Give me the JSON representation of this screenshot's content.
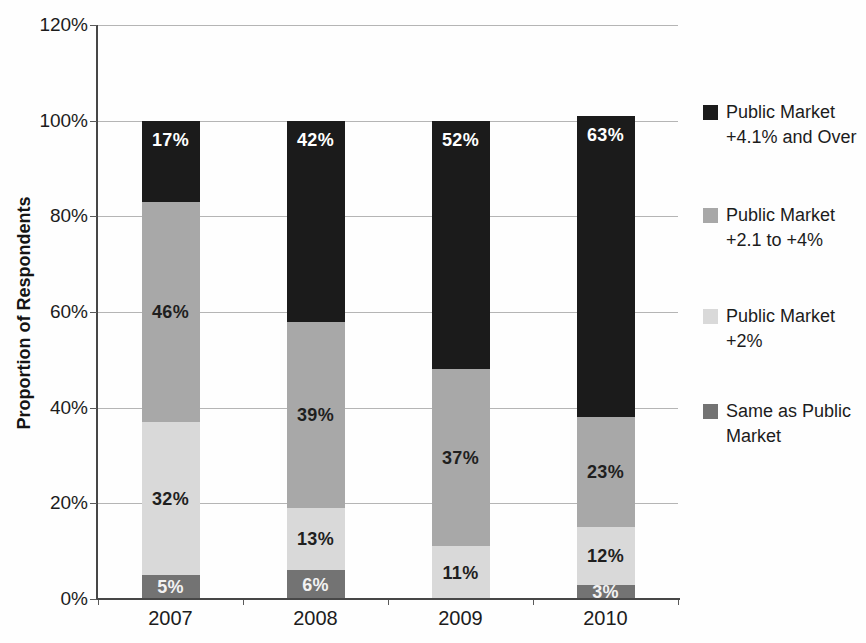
{
  "chart_data": {
    "type": "bar",
    "stacked": true,
    "title": "",
    "ylabel": "Proportion of Respondents",
    "xlabel": "",
    "ylim": [
      0,
      120
    ],
    "y_ticks": [
      "0%",
      "20%",
      "40%",
      "60%",
      "80%",
      "100%",
      "120%"
    ],
    "grid": true,
    "legend_position": "right",
    "categories": [
      "2007",
      "2008",
      "2009",
      "2010"
    ],
    "series": [
      {
        "name": "Same as Public Market",
        "color": "#737373",
        "label_color": "#f2f2f2",
        "label_position": "center",
        "values": [
          5,
          6,
          0,
          3
        ]
      },
      {
        "name": "Public Market +2%",
        "color": "#d9d9d9",
        "label_color": "#1f1f1f",
        "label_position": "center",
        "values": [
          32,
          13,
          11,
          12
        ]
      },
      {
        "name": "Public Market +2.1 to +4%",
        "color": "#a8a8a8",
        "label_color": "#1f1f1f",
        "label_position": "center",
        "values": [
          46,
          39,
          37,
          23
        ]
      },
      {
        "name": "Public Market +4.1% and Over",
        "color": "#1b1b1b",
        "label_color": "#ffffff",
        "label_position": "top",
        "values": [
          17,
          42,
          52,
          63
        ]
      }
    ],
    "legend": [
      {
        "series": "Public Market +4.1% and Over",
        "lines": [
          "Public Market",
          "+4.1% and Over"
        ],
        "color": "#1b1b1b"
      },
      {
        "series": "Public Market +2.1 to +4%",
        "lines": [
          "Public Market",
          "+2.1 to +4%"
        ],
        "color": "#a8a8a8"
      },
      {
        "series": "Public Market +2%",
        "lines": [
          "Public Market",
          "+2%"
        ],
        "color": "#d9d9d9"
      },
      {
        "series": "Same as Public Market",
        "lines": [
          "Same as Public",
          "Market"
        ],
        "color": "#737373"
      }
    ],
    "data_label_suffix": "%"
  }
}
